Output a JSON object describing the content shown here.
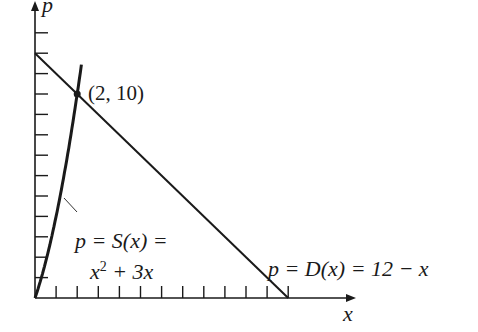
{
  "chart_data": {
    "type": "line",
    "title": "",
    "xlabel": "x",
    "ylabel": "p",
    "xlim": [
      0,
      12.5
    ],
    "ylim": [
      0,
      13.5
    ],
    "x_ticks": [
      1,
      2,
      3,
      4,
      5,
      6,
      7,
      8,
      9,
      10,
      11,
      12
    ],
    "y_ticks": [
      1,
      2,
      3,
      4,
      5,
      6,
      7,
      8,
      9,
      10,
      11,
      12,
      13
    ],
    "tick_labels_shown": false,
    "grid": false,
    "legend": null,
    "series": [
      {
        "name": "p = S(x) = x^2 + 3x",
        "kind": "supply curve",
        "x": [
          0,
          0.5,
          1,
          1.5,
          2,
          2.2
        ],
        "y": [
          0,
          1.75,
          4,
          6.75,
          10,
          11.44
        ]
      },
      {
        "name": "p = D(x) = 12 - x",
        "kind": "demand line",
        "x": [
          0,
          12
        ],
        "y": [
          12,
          0
        ]
      }
    ],
    "annotations": [
      {
        "text": "(2, 10)",
        "x": 2,
        "y": 10,
        "type": "intersection point"
      }
    ]
  },
  "labels": {
    "y_axis": "p",
    "x_axis": "x",
    "point": "(2, 10)",
    "supply_line1": "p = S(x) =",
    "supply_line2_base": "x",
    "supply_line2_exp": "2",
    "supply_line2_rest": " + 3x",
    "demand": "p = D(x) = 12 − x"
  },
  "colors": {
    "ink": "#1a1a1a",
    "background": "#ffffff"
  }
}
